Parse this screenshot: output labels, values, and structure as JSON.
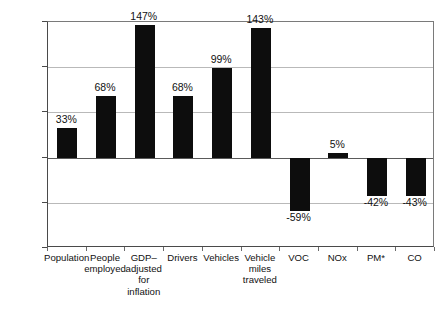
{
  "chart_data": {
    "type": "bar",
    "title": "",
    "subtitle": "",
    "xlabel": "",
    "ylabel": "",
    "ylim": [
      -100,
      150
    ],
    "ytick_values": [
      150,
      100,
      50,
      0,
      -50,
      -100
    ],
    "ytick_labels": [
      "150%",
      "100%",
      "50%",
      "0%",
      "-50%",
      "-100%"
    ],
    "grid": true,
    "legend": "none",
    "bar_color": "#0d0d0d",
    "categories": [
      "Population",
      "People employed",
      "GDP– adjusted for inflation",
      "Drivers",
      "Vehicles",
      "Vehicle miles traveled",
      "VOC",
      "NOx",
      "PM*",
      "CO"
    ],
    "category_lines": [
      [
        "Population"
      ],
      [
        "People",
        "employed"
      ],
      [
        "GDP–",
        "adjusted",
        "for",
        "inflation"
      ],
      [
        "Drivers"
      ],
      [
        "Vehicles"
      ],
      [
        "Vehicle",
        "miles",
        "traveled"
      ],
      [
        "VOC"
      ],
      [
        "NOx"
      ],
      [
        "PM*"
      ],
      [
        "CO"
      ]
    ],
    "values": [
      33,
      68,
      147,
      68,
      99,
      143,
      -59,
      5,
      -42,
      -43
    ],
    "value_labels": [
      "33%",
      "68%",
      "147%",
      "68%",
      "99%",
      "143%",
      "-59%",
      "5%",
      "-42%",
      "-43%"
    ]
  }
}
